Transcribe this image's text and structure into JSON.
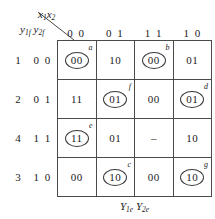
{
  "header": {
    "column_variable": "x1x2",
    "column_variable_base": "x",
    "row_variable": "y1f y2f"
  },
  "caption": "Y1e Y2e",
  "columns": [
    "0 0",
    "0 1",
    "1 1",
    "1 0"
  ],
  "rows": [
    {
      "state": "1",
      "code": "0 0",
      "cells": [
        {
          "value": "00",
          "stable": true,
          "tag": "a"
        },
        {
          "value": "10",
          "stable": false,
          "tag": ""
        },
        {
          "value": "00",
          "stable": true,
          "tag": "b"
        },
        {
          "value": "01",
          "stable": false,
          "tag": ""
        }
      ]
    },
    {
      "state": "2",
      "code": "0 1",
      "cells": [
        {
          "value": "11",
          "stable": false,
          "tag": ""
        },
        {
          "value": "01",
          "stable": true,
          "tag": "f"
        },
        {
          "value": "00",
          "stable": false,
          "tag": ""
        },
        {
          "value": "01",
          "stable": true,
          "tag": "d"
        }
      ]
    },
    {
      "state": "4",
      "code": "1 1",
      "cells": [
        {
          "value": "11",
          "stable": true,
          "tag": "e"
        },
        {
          "value": "01",
          "stable": false,
          "tag": ""
        },
        {
          "value": "–",
          "stable": false,
          "tag": ""
        },
        {
          "value": "10",
          "stable": false,
          "tag": ""
        }
      ]
    },
    {
      "state": "3",
      "code": "1 0",
      "cells": [
        {
          "value": "00",
          "stable": false,
          "tag": ""
        },
        {
          "value": "10",
          "stable": true,
          "tag": "c"
        },
        {
          "value": "00",
          "stable": false,
          "tag": ""
        },
        {
          "value": "10",
          "stable": true,
          "tag": "g"
        }
      ]
    }
  ]
}
